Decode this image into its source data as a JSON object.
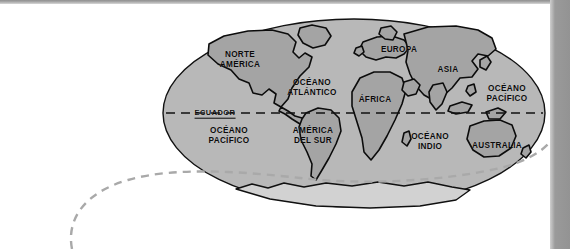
{
  "page": {
    "background_color": "#ffffff"
  },
  "chrome": {
    "top_bar_color": "#9a9a9a",
    "right_bar_color": "#939393"
  },
  "map": {
    "projection": "elliptical-world",
    "ocean_fill": "#b8b8b8",
    "land_fill": "#a0a0a0",
    "antarctica_fill": "#cfcfcf",
    "outline_color": "#111111",
    "equator_line_color": "#111111",
    "equator_line_style": "dashed",
    "labels": [
      {
        "name": "norte-america",
        "text": "NORTE\nAMÉRICA",
        "x": 240,
        "y": 60
      },
      {
        "name": "oceano-atlantico",
        "text": "OCÉANO\nATLÁNTICO",
        "x": 312,
        "y": 88
      },
      {
        "name": "europa",
        "text": "EUROPA",
        "x": 399,
        "y": 50
      },
      {
        "name": "asia",
        "text": "ASIA",
        "x": 448,
        "y": 70
      },
      {
        "name": "oceano-pacifico-este",
        "text": "OCÉANO\nPACÍFICO",
        "x": 507,
        "y": 94
      },
      {
        "name": "africa",
        "text": "ÁFRICA",
        "x": 375,
        "y": 100
      },
      {
        "name": "ecuador",
        "text": "ECUADOR",
        "x": 215,
        "y": 113,
        "style": "equator"
      },
      {
        "name": "oceano-pacifico-oeste",
        "text": "OCÉANO\nPACÍFICO",
        "x": 229,
        "y": 136
      },
      {
        "name": "america-del-sur",
        "text": "AMÉRICA\nDEL SUR",
        "x": 313,
        "y": 136
      },
      {
        "name": "oceano-indico",
        "text": "OCÉANO\nINDIO",
        "x": 430,
        "y": 142
      },
      {
        "name": "australia",
        "text": "AUSTRALIA",
        "x": 497,
        "y": 146
      }
    ]
  },
  "annotation": {
    "curve_color": "#a9a9a9",
    "curve_style": "dashed",
    "description": "gray dashed leader curve"
  }
}
